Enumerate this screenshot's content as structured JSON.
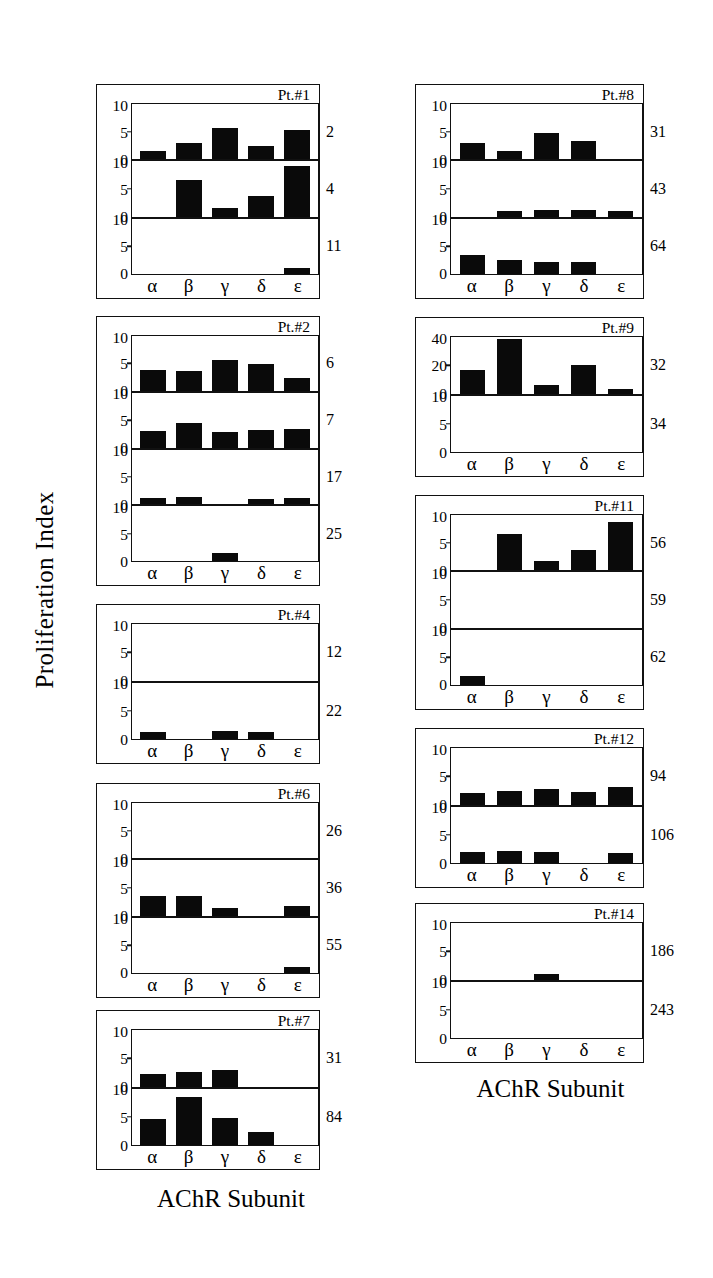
{
  "figure": {
    "y_axis_title": "Proliferation Index",
    "x_axis_caption_left": "AChR Subunit",
    "x_axis_caption_right": "AChR Subunit",
    "subunits": [
      "α",
      "β",
      "γ",
      "δ",
      "ε"
    ],
    "bar_color": "#0a0a0a",
    "frame_color": "#111111"
  },
  "chart_data": {
    "type": "bar",
    "xlabel": "AChR Subunit",
    "ylabel": "Proliferation Index",
    "categories": [
      "α",
      "β",
      "γ",
      "δ",
      "ε"
    ],
    "default_ylim": [
      0,
      10
    ],
    "default_yticks": [
      0,
      5,
      10
    ],
    "grid": false,
    "legend": "none",
    "panels": [
      {
        "patient": "Pt.#1",
        "column": "left",
        "rows": [
          {
            "label": "2",
            "ylim": [
              0,
              10
            ],
            "yticks": [
              0,
              5,
              10
            ],
            "values": [
              1.5,
              3.0,
              5.8,
              2.5,
              5.5
            ]
          },
          {
            "label": "4",
            "ylim": [
              0,
              10
            ],
            "yticks": [
              0,
              5,
              10
            ],
            "values": [
              0.0,
              6.8,
              1.7,
              3.9,
              9.5
            ]
          },
          {
            "label": "11",
            "ylim": [
              0,
              10
            ],
            "yticks": [
              0,
              5,
              10
            ],
            "values": [
              0.0,
              0.0,
              0.0,
              0.0,
              1.2
            ]
          }
        ]
      },
      {
        "patient": "Pt.#2",
        "column": "left",
        "rows": [
          {
            "label": "6",
            "ylim": [
              0,
              10
            ],
            "yticks": [
              0,
              5,
              10
            ],
            "values": [
              4.0,
              3.7,
              5.8,
              5.0,
              2.5
            ]
          },
          {
            "label": "7",
            "ylim": [
              0,
              10
            ],
            "yticks": [
              0,
              5,
              10
            ],
            "values": [
              3.2,
              4.7,
              2.9,
              3.3,
              3.5
            ]
          },
          {
            "label": "17",
            "ylim": [
              0,
              10
            ],
            "yticks": [
              0,
              5,
              10
            ],
            "values": [
              1.1,
              1.3,
              0.0,
              1.0,
              1.2
            ]
          },
          {
            "label": "25",
            "ylim": [
              0,
              10
            ],
            "yticks": [
              0,
              5,
              10
            ],
            "values": [
              0.0,
              0.0,
              1.5,
              0.0,
              0.0
            ]
          }
        ]
      },
      {
        "patient": "Pt.#4",
        "column": "left",
        "rows": [
          {
            "label": "12",
            "ylim": [
              0,
              10
            ],
            "yticks": [
              0,
              5,
              10
            ],
            "values": [
              0.0,
              0.0,
              0.0,
              0.0,
              0.0
            ]
          },
          {
            "label": "22",
            "ylim": [
              0,
              10
            ],
            "yticks": [
              0,
              5,
              10
            ],
            "values": [
              1.2,
              0.0,
              1.4,
              1.2,
              0.0
            ]
          }
        ]
      },
      {
        "patient": "Pt.#6",
        "column": "left",
        "rows": [
          {
            "label": "26",
            "ylim": [
              0,
              10
            ],
            "yticks": [
              0,
              5,
              10
            ],
            "values": [
              0.0,
              0.0,
              0.0,
              0.0,
              0.0
            ]
          },
          {
            "label": "36",
            "ylim": [
              0,
              10
            ],
            "yticks": [
              0,
              5,
              10
            ],
            "values": [
              3.6,
              3.7,
              1.5,
              0.0,
              1.9
            ]
          },
          {
            "label": "55",
            "ylim": [
              0,
              10
            ],
            "yticks": [
              0,
              5,
              10
            ],
            "values": [
              0.0,
              0.0,
              0.0,
              0.0,
              1.2
            ]
          }
        ]
      },
      {
        "patient": "Pt.#7",
        "column": "left",
        "rows": [
          {
            "label": "31",
            "ylim": [
              0,
              10
            ],
            "yticks": [
              0,
              5,
              10
            ],
            "values": [
              2.3,
              2.6,
              3.0,
              0.0,
              0.0
            ]
          },
          {
            "label": "84",
            "ylim": [
              0,
              10
            ],
            "yticks": [
              0,
              5,
              10
            ],
            "values": [
              4.8,
              8.8,
              5.0,
              2.4,
              0.0
            ]
          }
        ]
      },
      {
        "patient": "Pt.#8",
        "column": "right",
        "rows": [
          {
            "label": "31",
            "ylim": [
              0,
              10
            ],
            "yticks": [
              0,
              5,
              10
            ],
            "values": [
              3.0,
              1.6,
              4.9,
              3.5,
              0.0
            ]
          },
          {
            "label": "43",
            "ylim": [
              0,
              10
            ],
            "yticks": [
              0,
              5,
              10
            ],
            "values": [
              0.0,
              1.1,
              1.2,
              1.3,
              1.1
            ]
          },
          {
            "label": "64",
            "ylim": [
              0,
              10
            ],
            "yticks": [
              0,
              5,
              10
            ],
            "values": [
              3.5,
              2.7,
              2.2,
              2.2,
              0.0
            ]
          }
        ]
      },
      {
        "patient": "Pt.#9",
        "column": "right",
        "rows": [
          {
            "label": "32",
            "ylim": [
              0,
              40
            ],
            "yticks": [
              0,
              20,
              40
            ],
            "values": [
              17.0,
              40.0,
              6.0,
              21.0,
              3.0
            ]
          },
          {
            "label": "34",
            "ylim": [
              0,
              10
            ],
            "yticks": [
              0,
              5,
              10
            ],
            "values": [
              0.0,
              0.0,
              0.0,
              0.0,
              0.0
            ]
          }
        ]
      },
      {
        "patient": "Pt.#11",
        "column": "right",
        "rows": [
          {
            "label": "56",
            "ylim": [
              0,
              10
            ],
            "yticks": [
              0,
              5,
              10
            ],
            "values": [
              0.0,
              6.8,
              1.8,
              3.9,
              9.0
            ]
          },
          {
            "label": "59",
            "ylim": [
              0,
              10
            ],
            "yticks": [
              0,
              5,
              10
            ],
            "values": [
              0.0,
              0.0,
              0.0,
              0.0,
              0.0
            ]
          },
          {
            "label": "62",
            "ylim": [
              0,
              10
            ],
            "yticks": [
              0,
              5,
              10
            ],
            "values": [
              1.6,
              0.0,
              0.0,
              0.0,
              0.0
            ]
          }
        ]
      },
      {
        "patient": "Pt.#12",
        "column": "right",
        "rows": [
          {
            "label": "94",
            "ylim": [
              0,
              10
            ],
            "yticks": [
              0,
              5,
              10
            ],
            "values": [
              2.1,
              2.5,
              2.9,
              2.3,
              3.2
            ]
          },
          {
            "label": "106",
            "ylim": [
              0,
              10
            ],
            "yticks": [
              0,
              5,
              10
            ],
            "values": [
              2.0,
              2.2,
              2.0,
              0.0,
              1.9
            ]
          }
        ]
      },
      {
        "patient": "Pt.#14",
        "column": "right",
        "rows": [
          {
            "label": "186",
            "ylim": [
              0,
              10
            ],
            "yticks": [
              0,
              5,
              10
            ],
            "values": [
              0.0,
              0.0,
              1.1,
              0.0,
              0.0
            ]
          },
          {
            "label": "243",
            "ylim": [
              0,
              10
            ],
            "yticks": [
              0,
              5,
              10
            ],
            "values": [
              0.0,
              0.0,
              0.0,
              0.0,
              0.0
            ]
          }
        ]
      }
    ]
  },
  "layout": {
    "panel_geometry": {
      "left": [
        {
          "patient": "Pt.#1",
          "top": 84,
          "height": 215,
          "row_h": 57
        },
        {
          "patient": "Pt.#2",
          "top": 316,
          "height": 270,
          "row_h": 57
        },
        {
          "patient": "Pt.#4",
          "top": 604,
          "height": 160,
          "row_h": 57
        },
        {
          "patient": "Pt.#6",
          "top": 783,
          "height": 215,
          "row_h": 57
        },
        {
          "patient": "Pt.#7",
          "top": 1010,
          "height": 160,
          "row_h": 57
        }
      ],
      "right": [
        {
          "patient": "Pt.#8",
          "top": 84,
          "height": 215,
          "row_h": 57
        },
        {
          "patient": "Pt.#9",
          "top": 317,
          "height": 160,
          "row_h": 57
        },
        {
          "patient": "Pt.#11",
          "top": 495,
          "height": 215,
          "row_h": 57
        },
        {
          "patient": "Pt.#12",
          "top": 728,
          "height": 160,
          "row_h": 57
        },
        {
          "patient": "Pt.#14",
          "top": 903,
          "height": 160,
          "row_h": 57
        }
      ]
    }
  }
}
